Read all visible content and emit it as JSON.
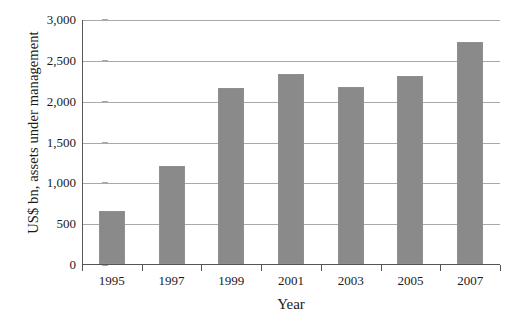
{
  "chart_data": {
    "type": "bar",
    "title": "",
    "subtitle": "",
    "xlabel": "Year",
    "ylabel": "US$ bn, assets under management",
    "categories": [
      "1995",
      "1997",
      "1999",
      "2001",
      "2003",
      "2005",
      "2007"
    ],
    "values": [
      650,
      1200,
      2150,
      2330,
      2170,
      2300,
      2720
    ],
    "series": [
      {
        "name": "Assets under management",
        "values": [
          650,
          1200,
          2150,
          2330,
          2170,
          2300,
          2720
        ]
      }
    ],
    "ylim": [
      0,
      3000
    ],
    "ytick_values": [
      0,
      500,
      1000,
      1500,
      2000,
      2500,
      3000
    ],
    "ytick_labels": [
      "0",
      "500",
      "1,000",
      "1,500",
      "2,000",
      "2,500",
      "3,000"
    ],
    "grid": true,
    "legend": "none",
    "bar_color": "#8a8a8a",
    "gridline_color": "#a9a9a9",
    "axis_color": "#555555",
    "background_color": "#ffffff"
  }
}
